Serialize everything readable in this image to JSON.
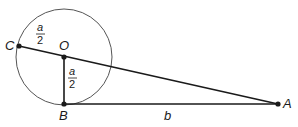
{
  "diagram": {
    "type": "geometry",
    "colors": {
      "stroke": "#1a1a1a",
      "circle": "#555555",
      "background": "#ffffff"
    },
    "points": {
      "C": {
        "label": "C",
        "x": 19,
        "y": 46
      },
      "O": {
        "label": "O",
        "x": 64,
        "y": 57
      },
      "B": {
        "label": "B",
        "x": 64,
        "y": 104
      },
      "A": {
        "label": "A",
        "x": 278,
        "y": 104
      }
    },
    "circle": {
      "center": "O",
      "cx": 64,
      "cy": 57,
      "r": 48
    },
    "segments": [
      {
        "from": "C",
        "to": "A"
      },
      {
        "from": "O",
        "to": "B"
      },
      {
        "from": "B",
        "to": "A"
      }
    ],
    "labels": {
      "CO": {
        "numerator": "a",
        "denominator": "2"
      },
      "OB": {
        "numerator": "a",
        "denominator": "2"
      },
      "BA": {
        "text": "b"
      }
    }
  }
}
